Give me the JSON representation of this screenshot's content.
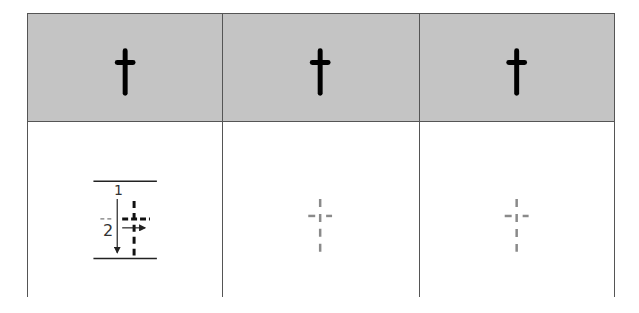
{
  "worksheet": {
    "letter": "t",
    "header_cells": [
      {
        "glyph": "t",
        "style": "solid"
      },
      {
        "glyph": "t",
        "style": "solid"
      },
      {
        "glyph": "t",
        "style": "solid"
      }
    ],
    "body_cells": [
      {
        "type": "stroke-order-guide",
        "strokes": [
          {
            "number": "1",
            "direction": "down"
          },
          {
            "number": "2",
            "direction": "right"
          }
        ]
      },
      {
        "type": "tracing-guide",
        "glyph": "t",
        "style": "dashed"
      },
      {
        "type": "tracing-guide",
        "glyph": "t",
        "style": "dashed"
      }
    ],
    "colors": {
      "header_bg": "#c4c4c4",
      "border": "#555555",
      "glyph": "#000000",
      "trace_dash": "#8a8a8a",
      "guide_ink": "#222222"
    }
  }
}
